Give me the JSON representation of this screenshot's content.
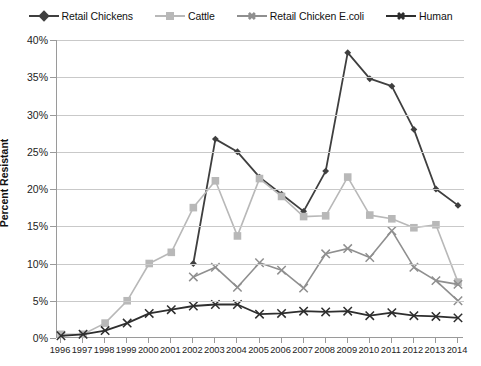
{
  "chart_data": {
    "type": "line",
    "title": "",
    "xlabel": "",
    "ylabel": "Percent Resistant",
    "x": [
      1996,
      1997,
      1998,
      1999,
      2000,
      2001,
      2002,
      2003,
      2004,
      2005,
      2006,
      2007,
      2008,
      2009,
      2010,
      2011,
      2012,
      2013,
      2014
    ],
    "xlim": [
      1996,
      2014
    ],
    "ylim": [
      0,
      40
    ],
    "ytick_labels": [
      "0%",
      "5%",
      "10%",
      "15%",
      "20%",
      "25%",
      "30%",
      "35%",
      "40%"
    ],
    "ytick_values": [
      0,
      5,
      10,
      15,
      20,
      25,
      30,
      35,
      40
    ],
    "xtick_labels": [
      "1996",
      "1997",
      "1998",
      "1999",
      "2000",
      "2001",
      "2002",
      "2003",
      "2004",
      "2005",
      "2006",
      "2007",
      "2008",
      "2009",
      "2010",
      "2011",
      "2012",
      "2013",
      "2014"
    ],
    "grid": true,
    "legend_position": "top",
    "series": [
      {
        "name": "Retail Chickens",
        "marker": "diamond",
        "color": "#3f3f3f",
        "values": [
          null,
          null,
          null,
          null,
          null,
          null,
          10.0,
          26.7,
          25.0,
          21.6,
          19.3,
          17.0,
          22.4,
          38.3,
          34.8,
          33.8,
          28.0,
          20.0,
          17.8
        ]
      },
      {
        "name": "Cattle",
        "marker": "square",
        "color": "#b8b8b8",
        "values": [
          0.5,
          0.5,
          2.0,
          5.0,
          10.0,
          11.5,
          17.5,
          21.1,
          13.7,
          21.4,
          19.0,
          16.3,
          16.4,
          21.6,
          16.5,
          16.0,
          14.8,
          15.2,
          7.5
        ]
      },
      {
        "name": "Retail Chicken E.coli",
        "marker": "x",
        "color": "#8f8f8f",
        "values": [
          null,
          null,
          null,
          null,
          null,
          null,
          8.2,
          9.5,
          6.8,
          10.1,
          9.1,
          6.7,
          11.3,
          12.0,
          10.8,
          14.4,
          9.5,
          7.7,
          5.0
        ]
      },
      {
        "name": "Human",
        "marker": "x",
        "color": "#2e2e2e",
        "values": [
          0.3,
          0.5,
          1.0,
          2.0,
          3.3,
          3.8,
          4.3,
          4.5,
          4.5,
          3.2,
          3.3,
          3.6,
          3.5,
          3.6,
          3.0,
          3.4,
          3.0,
          2.9,
          2.7
        ]
      }
    ],
    "extra_points": {
      "Retail Chicken E.coli_2014": 7.2
    }
  },
  "legend": {
    "items": [
      {
        "label": "Retail Chickens"
      },
      {
        "label": "Cattle"
      },
      {
        "label": "Retail Chicken E.coli"
      },
      {
        "label": "Human"
      }
    ]
  }
}
